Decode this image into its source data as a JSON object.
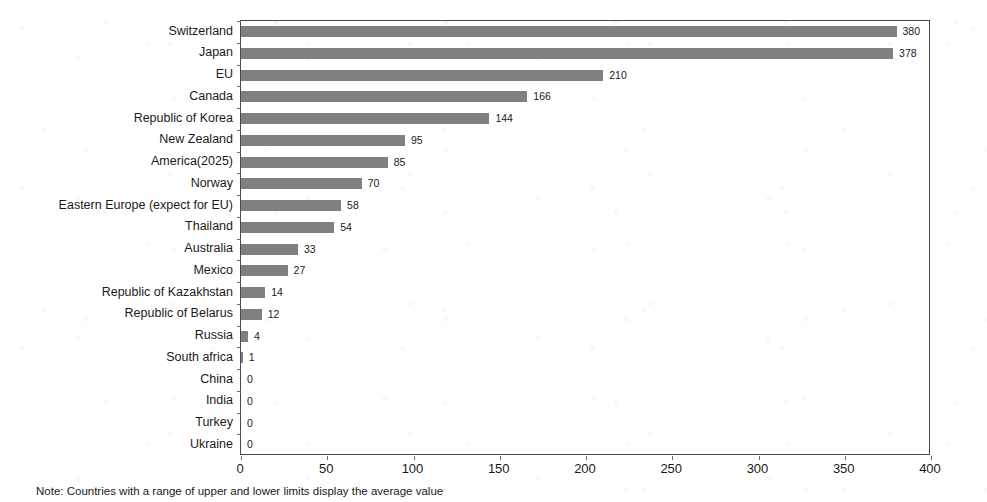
{
  "chart_data": {
    "type": "bar",
    "orientation": "horizontal",
    "title": "",
    "subtitle": "",
    "xlabel": "",
    "ylabel": "",
    "xlim": [
      0,
      400
    ],
    "xticks": [
      "0",
      "50",
      "100",
      "150",
      "200",
      "250",
      "300",
      "350",
      "400"
    ],
    "xtick_values": [
      0,
      50,
      100,
      150,
      200,
      250,
      300,
      350,
      400
    ],
    "grid": false,
    "legend": false,
    "bar_color": "#808080",
    "axis_color": "#4a4a4a",
    "text_color": "#1a1a1a",
    "categories": [
      "Switzerland",
      "Japan",
      "EU",
      "Canada",
      "Republic of Korea",
      "New Zealand",
      "America(2025)",
      "Norway",
      "Eastern Europe (expect for EU)",
      "Thailand",
      "Australia",
      "Mexico",
      "Republic of Kazakhstan",
      "Republic of Belarus",
      "Russia",
      "South africa",
      "China",
      "India",
      "Turkey",
      "Ukraine"
    ],
    "values": [
      380,
      378,
      210,
      166,
      144,
      95,
      85,
      70,
      58,
      54,
      33,
      27,
      14,
      12,
      4,
      1,
      0,
      0,
      0,
      0
    ],
    "value_labels": [
      "380",
      "378",
      "210",
      "166",
      "144",
      "95",
      "85",
      "70",
      "58",
      "54",
      "33",
      "27",
      "14",
      "12",
      "4",
      "1",
      "0",
      "0",
      "0",
      "0"
    ]
  },
  "note": {
    "text": "Note:  Countries with a range of upper and lower limits display the average value"
  }
}
